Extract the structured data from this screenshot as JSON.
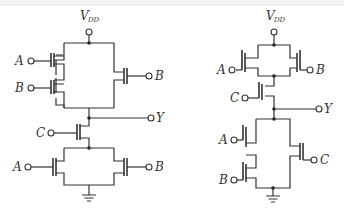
{
  "diagram": {
    "colors": {
      "wire": "#333333",
      "background": "#ffffff"
    },
    "left_circuit": {
      "supply_label": "V",
      "supply_sub": "DD",
      "inputs": {
        "a_top": "A",
        "b_top": "B",
        "b_right": "B",
        "c": "C",
        "a_bot": "A",
        "b_bot": "B"
      },
      "output": "Y"
    },
    "right_circuit": {
      "supply_label": "V",
      "supply_sub": "DD",
      "inputs": {
        "a_top": "A",
        "b_top": "B",
        "c": "C",
        "a_bot": "A",
        "b_bot": "B",
        "c_bot": "C"
      },
      "output": "Y"
    }
  }
}
